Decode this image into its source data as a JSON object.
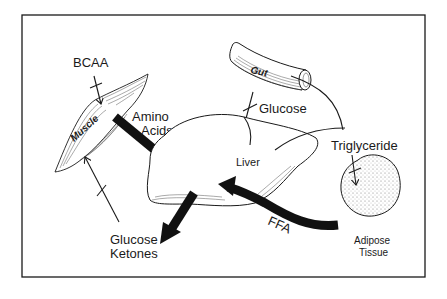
{
  "diagram": {
    "type": "metabolic-pathway-schematic",
    "labels": {
      "bcaa": "BCAA",
      "muscle": "Muscle",
      "amino_acids_line1": "Amino",
      "amino_acids_line2": "Acids",
      "gut": "Gut",
      "glucose_from_gut": "Glucose",
      "liver": "Liver",
      "triglyceride": "Triglyceride",
      "adipose_line1": "Adipose",
      "adipose_line2": "Tissue",
      "ffa": "FFA",
      "output_line1": "Glucose",
      "output_line2": "Ketones"
    },
    "nodes": [
      {
        "id": "muscle",
        "label": "Muscle"
      },
      {
        "id": "gut",
        "label": "Gut"
      },
      {
        "id": "liver",
        "label": "Liver"
      },
      {
        "id": "adipose",
        "label": "Adipose Tissue"
      }
    ],
    "edges": [
      {
        "from": "BCAA",
        "to": "muscle",
        "style": "thin-blocked"
      },
      {
        "from": "muscle",
        "to": "liver",
        "label": "Amino Acids",
        "style": "thick"
      },
      {
        "from": "gut",
        "to": "liver",
        "label": "Glucose",
        "style": "thin-blocked"
      },
      {
        "from": "gut",
        "to": "Triglyceride",
        "style": "thin-curve"
      },
      {
        "from": "liver",
        "to": "Triglyceride",
        "style": "thin-curve"
      },
      {
        "from": "Triglyceride",
        "to": "adipose",
        "style": "thin-blocked"
      },
      {
        "from": "adipose",
        "to": "liver",
        "label": "FFA",
        "style": "thick"
      },
      {
        "from": "liver",
        "to": "Glucose Ketones",
        "style": "thick"
      },
      {
        "from": "Glucose Ketones",
        "to": "muscle",
        "style": "thin-blocked"
      }
    ],
    "colors": {
      "ink": "#1a1a1a",
      "background": "#ffffff"
    }
  }
}
